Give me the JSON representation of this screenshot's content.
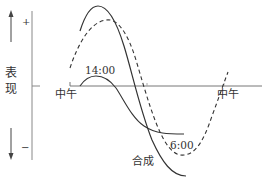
{
  "diagram": {
    "y_axis": {
      "label_chars": [
        "表",
        "现"
      ],
      "positive_sign": "+",
      "negative_sign": "−"
    },
    "x_axis": {
      "start_label": "中午",
      "end_label": "中午"
    },
    "annotations": {
      "peak_time": "14:00",
      "trough_time": "6:00",
      "composite_label": "合成"
    },
    "curves": [
      {
        "name": "small-rhythm",
        "style": "solid",
        "description": "small hump peaking near 14:00, descending to low plateau"
      },
      {
        "name": "composite",
        "style": "solid",
        "description": "large solid curve peaking early, descending to deep trough"
      },
      {
        "name": "circadian",
        "style": "dashed",
        "description": "dashed sinusoid peaking later, trough at 6:00, returns to baseline at noon"
      }
    ],
    "colors": {
      "line": "#333333",
      "axis": "#555555"
    }
  }
}
